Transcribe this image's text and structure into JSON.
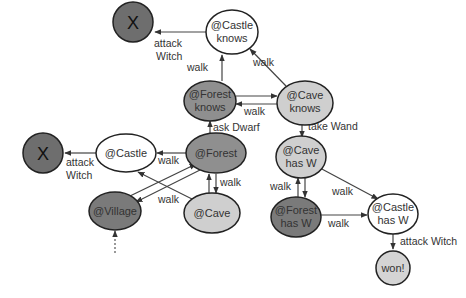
{
  "colors": {
    "dark": "#6e6e6e",
    "medium": "#8f8f8f",
    "light": "#cfcfcf",
    "white": "#ffffff",
    "stroke": "#222222"
  },
  "nodes": {
    "x_top": {
      "label": "X"
    },
    "castle_knows": {
      "line1": "@Castle",
      "line2": "knows"
    },
    "forest_knows": {
      "line1": "@Forest",
      "line2": "knows"
    },
    "cave_knows": {
      "line1": "@Cave",
      "line2": "knows"
    },
    "x_left": {
      "label": "X"
    },
    "castle": {
      "label": "@Castle"
    },
    "forest": {
      "label": "@Forest"
    },
    "village": {
      "label": "@Village"
    },
    "cave": {
      "label": "@Cave"
    },
    "cave_has_w": {
      "line1": "@Cave",
      "line2": "has W"
    },
    "forest_has_w": {
      "line1": "@Forest",
      "line2": "has W"
    },
    "castle_has_w": {
      "line1": "@Castle",
      "line2": "has W"
    },
    "won": {
      "label": "won!"
    }
  },
  "edges": {
    "castle_knows_to_x": {
      "line1": "attack",
      "line2": "Witch"
    },
    "forest_knows_to_castle_knows": "walk",
    "cave_knows_to_castle_knows": "walk",
    "forest_knows_cave_knows": "walk",
    "forest_to_forest_knows": "ask Dwarf",
    "cave_knows_to_cave_has_w": "take Wand",
    "castle_to_x": {
      "line1": "attack",
      "line2": "Witch"
    },
    "forest_to_castle": "walk",
    "forest_cave": "walk",
    "village_forest": "walk",
    "cave_has_w_forest_has_w": "walk",
    "cave_has_w_to_castle_has_w": "walk",
    "forest_has_w_to_castle_has_w": "walk",
    "castle_has_w_to_won": "attack Witch"
  }
}
